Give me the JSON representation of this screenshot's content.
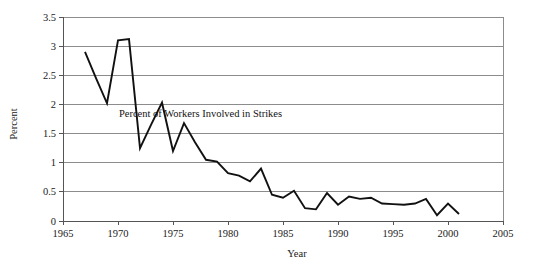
{
  "chart_data": {
    "type": "line",
    "title": "",
    "xlabel": "Year",
    "ylabel": "Percent",
    "xlim": [
      1965,
      2005
    ],
    "ylim": [
      0,
      3.5
    ],
    "xticks": [
      1965,
      1970,
      1975,
      1980,
      1985,
      1990,
      1995,
      2000,
      2005
    ],
    "xtick_labels": [
      "1965",
      "1970",
      "1975",
      "1980",
      "1985",
      "1990",
      "1995",
      "2000",
      "2005"
    ],
    "yticks": [
      0,
      0.5,
      1,
      1.5,
      2,
      2.5,
      3,
      3.5
    ],
    "ytick_labels": [
      "0",
      "0.5",
      "1",
      "1.5",
      "2",
      "2.5",
      "3",
      "3.5"
    ],
    "grid": true,
    "legend": "none",
    "annotations": [
      {
        "text": "Percent of Workers Involved in Strikes",
        "x": 1977.5,
        "y": 1.78
      }
    ],
    "series": [
      {
        "name": "Percent of Workers Involved in Strikes",
        "color": "#111111",
        "x": [
          1967,
          1968,
          1969,
          1970,
          1971,
          1972,
          1973,
          1974,
          1975,
          1976,
          1977,
          1978,
          1979,
          1980,
          1981,
          1982,
          1983,
          1984,
          1985,
          1986,
          1987,
          1988,
          1989,
          1990,
          1991,
          1992,
          1993,
          1994,
          1995,
          1996,
          1997,
          1998,
          1999,
          2000,
          2001
        ],
        "values": [
          2.9,
          2.45,
          2.02,
          3.1,
          3.12,
          1.25,
          1.65,
          2.03,
          1.2,
          1.68,
          1.35,
          1.05,
          1.02,
          0.82,
          0.78,
          0.68,
          0.9,
          0.45,
          0.4,
          0.52,
          0.22,
          0.2,
          0.48,
          0.28,
          0.42,
          0.38,
          0.4,
          0.3,
          0.29,
          0.28,
          0.3,
          0.38,
          0.1,
          0.3,
          0.12
        ]
      }
    ]
  },
  "axis": {
    "y_label": "Percent",
    "x_label": "Year"
  }
}
